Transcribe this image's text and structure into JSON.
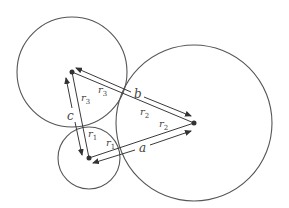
{
  "diagram": {
    "colors": {
      "stroke": "#555555",
      "text": "#444444",
      "background": "#ffffff"
    },
    "circles": [
      {
        "id": "c1",
        "cx": 89,
        "cy": 158,
        "r": 31
      },
      {
        "id": "c2",
        "cx": 194,
        "cy": 123,
        "r": 78
      },
      {
        "id": "c3",
        "cx": 72,
        "cy": 72,
        "r": 55
      }
    ],
    "labels": {
      "a": "a",
      "b": "b",
      "c": "c",
      "r": "r",
      "sub1": "1",
      "sub2": "2",
      "sub3": "3"
    }
  }
}
